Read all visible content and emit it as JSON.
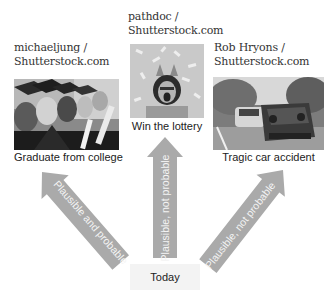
{
  "diagram": {
    "origin": {
      "label": "Today"
    },
    "outcomes": [
      {
        "credit_line1": "michaeljung /",
        "credit_line2": "Shutterstock.com",
        "image": "graduates-photo",
        "caption": "Graduate from college",
        "arrow_label": "Plausible and probable"
      },
      {
        "credit_line1": "pathdoc /",
        "credit_line2": "Shutterstock.com",
        "image": "lottery-winner-photo",
        "caption": "Win the lottery",
        "arrow_label": "Plausible, not probable"
      },
      {
        "credit_line1": "Rob Hryons /",
        "credit_line2": "Shutterstock.com",
        "image": "car-accident-photo",
        "caption": "Tragic car accident",
        "arrow_label": "Plausible, not probable"
      }
    ],
    "colors": {
      "arrow": "#aaaaaa",
      "arrow_text": "#f4f4f4",
      "origin_box": "#f3f3f3",
      "credit_text": "#333333"
    }
  }
}
